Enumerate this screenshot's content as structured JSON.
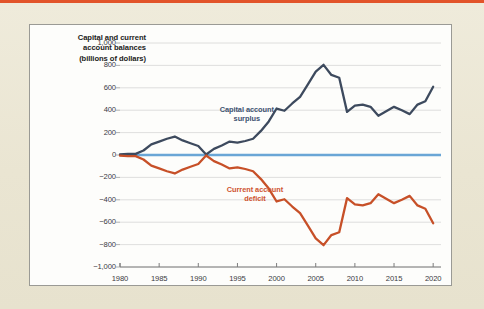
{
  "page": {
    "background_color": "#ece7d5",
    "top_rule_color": "#e2542a",
    "panel_background": "#fdfdfb",
    "panel_border_color": "#9a9a95"
  },
  "chart_data": {
    "type": "line",
    "title": "Capital and current account balances (billions of dollars)",
    "title_lines": [
      "Capital and current",
      "account balances",
      "(billions of dollars)"
    ],
    "xlabel": "",
    "ylabel": "Capital and current account balances (billions of dollars)",
    "xlim": [
      1980,
      2021
    ],
    "ylim": [
      -1000,
      1000
    ],
    "grid": true,
    "grid_color": "#d6d6d6",
    "zero_line_color": "#6aa6d6",
    "legend_position": "inline-annotations",
    "ytick_labels": [
      "1,000",
      "800",
      "600",
      "400",
      "200",
      "0",
      "−200",
      "−400",
      "−600",
      "−800",
      "−1,000"
    ],
    "ytick_values": [
      1000,
      800,
      600,
      400,
      200,
      0,
      -200,
      -400,
      -600,
      -800,
      -1000
    ],
    "xtick_labels": [
      "1980",
      "1985",
      "1990",
      "1995",
      "2000",
      "2005",
      "2010",
      "2015",
      "2020"
    ],
    "xtick_values": [
      1980,
      1985,
      1990,
      1995,
      2000,
      2005,
      2010,
      2015,
      2020
    ],
    "x": [
      1980,
      1981,
      1982,
      1983,
      1984,
      1985,
      1986,
      1987,
      1988,
      1989,
      1990,
      1991,
      1992,
      1993,
      1994,
      1995,
      1996,
      1997,
      1998,
      1999,
      2000,
      2001,
      2002,
      2003,
      2004,
      2005,
      2006,
      2007,
      2008,
      2009,
      2010,
      2011,
      2012,
      2013,
      2014,
      2015,
      2016,
      2017,
      2018,
      2019,
      2020
    ],
    "series": [
      {
        "name": "Capital account surplus",
        "label_lines": [
          "Capital account",
          "surplus"
        ],
        "color": "#3d4a5e",
        "values": [
          5,
          10,
          10,
          40,
          95,
          120,
          145,
          165,
          130,
          105,
          80,
          5,
          55,
          85,
          120,
          110,
          125,
          145,
          215,
          300,
          415,
          395,
          460,
          520,
          630,
          745,
          805,
          715,
          690,
          385,
          440,
          450,
          430,
          350,
          390,
          430,
          400,
          365,
          450,
          480,
          610
        ]
      },
      {
        "name": "Current account deficit",
        "label_lines": [
          "Current account",
          "deficit"
        ],
        "color": "#c75028",
        "values": [
          -5,
          -10,
          -10,
          -40,
          -95,
          -120,
          -145,
          -165,
          -130,
          -105,
          -80,
          -5,
          -55,
          -85,
          -120,
          -110,
          -125,
          -145,
          -215,
          -300,
          -415,
          -395,
          -460,
          -520,
          -630,
          -745,
          -805,
          -715,
          -690,
          -385,
          -440,
          -450,
          -430,
          -350,
          -390,
          -430,
          -400,
          -365,
          -450,
          -480,
          -610
        ]
      }
    ]
  }
}
